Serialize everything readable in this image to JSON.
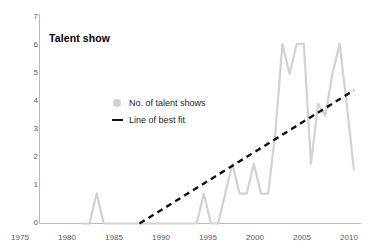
{
  "chart_data": {
    "type": "line",
    "title": "Talent show",
    "xlabel": "",
    "ylabel": "",
    "xlim": [
      1975,
      2020
    ],
    "ylim": [
      0,
      7
    ],
    "grid": false,
    "legend_position": "inner-left",
    "x_ticks": [
      "1975",
      "1980",
      "1985",
      "1990",
      "1995",
      "2000",
      "2005",
      "2010",
      "2015",
      "2020"
    ],
    "y_ticks": [
      "0",
      "1",
      "2",
      "3",
      "4",
      "5",
      "6",
      "7"
    ],
    "series": [
      {
        "name": "No. of talent shows",
        "color": "#d2d2d2",
        "marker": "circle",
        "x": [
          1981,
          1982,
          1983,
          1984,
          1985,
          1986,
          1987,
          1988,
          1989,
          1990,
          1991,
          1992,
          1993,
          1994,
          1995,
          1996,
          1997,
          1998,
          1999,
          2000,
          2001,
          2002,
          2003,
          2004,
          2005,
          2006,
          2007,
          2008,
          2009,
          2010,
          2011,
          2012,
          2013,
          2014,
          2015,
          2016,
          2017,
          2018,
          2019
        ],
        "values": [
          0,
          0,
          1,
          0,
          0,
          0,
          0,
          0,
          0,
          0,
          0,
          0,
          0,
          0,
          0,
          0,
          0,
          1,
          0,
          0,
          1,
          2,
          1,
          1,
          2,
          1,
          1,
          3,
          6,
          5,
          6,
          6,
          2,
          4,
          3.6,
          5,
          6,
          4,
          1.8
        ]
      },
      {
        "name": "Line of best fit",
        "color": "#111111",
        "style": "dashed",
        "x": [
          1989,
          2019
        ],
        "values": [
          0,
          4.45
        ]
      }
    ]
  },
  "legend": {
    "items": [
      {
        "label": "No. of talent shows",
        "marker": "dot-marker"
      },
      {
        "label": "Line of best fit",
        "marker": "dash-marker"
      }
    ]
  }
}
